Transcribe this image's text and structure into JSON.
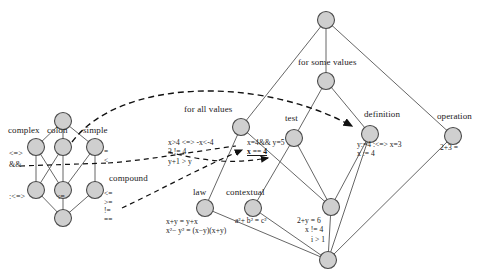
{
  "figure": {
    "type": "concept-lattice-diagram",
    "background_color": "#ffffff",
    "node_fill": "#cfcfcf",
    "node_stroke": "#4a4a4a",
    "edge_color": "#555555",
    "arrow_color": "#111111"
  },
  "left_lattice": {
    "name": "expression-lattice",
    "concepts": [
      {
        "id": "L-top",
        "label": "",
        "x": 63,
        "y": 121
      },
      {
        "id": "L-complex",
        "label": "complex",
        "x": 36,
        "y": 147
      },
      {
        "id": "L-colon",
        "label": "colon",
        "x": 63,
        "y": 147
      },
      {
        "id": "L-simple",
        "label": "simple",
        "x": 95,
        "y": 147
      },
      {
        "id": "L-m1",
        "label": "",
        "x": 36,
        "y": 190
      },
      {
        "id": "L-m2",
        "label": "",
        "x": 63,
        "y": 190
      },
      {
        "id": "L-m3",
        "label": "compound",
        "x": 95,
        "y": 190
      },
      {
        "id": "L-bottom",
        "label": "",
        "x": 63,
        "y": 218
      }
    ],
    "concept_labels": [
      {
        "text": "complex",
        "x": 8,
        "y": 131
      },
      {
        "text": "colon",
        "x": 47,
        "y": 131
      },
      {
        "text": "simple",
        "x": 83,
        "y": 131
      },
      {
        "text": "compound",
        "x": 108,
        "y": 178
      }
    ],
    "attribute_labels": [
      {
        "text": "<=>",
        "x": 12,
        "y": 155
      },
      {
        "text": "&&",
        "x": 12,
        "y": 166
      },
      {
        "text": ":<=>",
        "x": 12,
        "y": 197
      },
      {
        "text": ":=",
        "x": 60,
        "y": 197
      }
    ],
    "operator_stack_simple": [
      "=",
      "<"
    ],
    "operator_stack_compound": [
      "<=",
      ">=",
      "!=",
      "=="
    ]
  },
  "right_lattice": {
    "name": "statement-lattice",
    "concepts": [
      {
        "id": "R-top",
        "label": "",
        "x": 326,
        "y": 20
      },
      {
        "id": "R-some",
        "label": "for some values",
        "x": 326,
        "y": 81
      },
      {
        "id": "R-forall",
        "label": "for all values",
        "x": 241,
        "y": 127
      },
      {
        "id": "R-test",
        "label": "test",
        "x": 294,
        "y": 138
      },
      {
        "id": "R-definition",
        "label": "definition",
        "x": 370,
        "y": 134
      },
      {
        "id": "R-operation",
        "label": "operation",
        "x": 453,
        "y": 136
      },
      {
        "id": "R-law",
        "label": "law",
        "x": 205,
        "y": 208
      },
      {
        "id": "R-contextual",
        "label": "contextual",
        "x": 253,
        "y": 208
      },
      {
        "id": "R-conditional",
        "label": "",
        "x": 331,
        "y": 207
      },
      {
        "id": "R-bottom",
        "label": "",
        "x": 328,
        "y": 260
      }
    ],
    "concept_labels": [
      {
        "text": "for some values",
        "x": 298,
        "y": 63
      },
      {
        "text": "for all values",
        "x": 184,
        "y": 110
      },
      {
        "text": "test",
        "x": 285,
        "y": 119
      },
      {
        "text": "definition",
        "x": 364,
        "y": 115
      },
      {
        "text": "operation",
        "x": 437,
        "y": 117
      },
      {
        "text": "law",
        "x": 193,
        "y": 192
      },
      {
        "text": "contextual",
        "x": 228,
        "y": 192
      }
    ]
  },
  "formulas": {
    "for_all_values": [
      "x>4 <=> -x<-4",
      "3 != 4",
      "y+1 > y"
    ],
    "test_top": "x=4&& y=5",
    "test_emphasis": "x == 4",
    "definition": [
      "y:=4 :<=> x=3",
      "x := 4"
    ],
    "operation": "2+3 =",
    "law": [
      "x+y = y+x",
      "x²− y² = (x−y)(x+y)"
    ],
    "contextual": "a²+ b² = c²",
    "conditional": [
      "2+y = 6",
      "x != 4",
      "i > 1"
    ]
  },
  "mappings": {
    "description": "dashed arrows linking left lattice attributes to right lattice concepts",
    "arrows": [
      {
        "from": "colon-node",
        "to": "definition-node"
      },
      {
        "from": "simple-operators",
        "to": "for-all-values-formulas"
      },
      {
        "from": "compound-operators",
        "to": "law-formulas"
      }
    ]
  }
}
